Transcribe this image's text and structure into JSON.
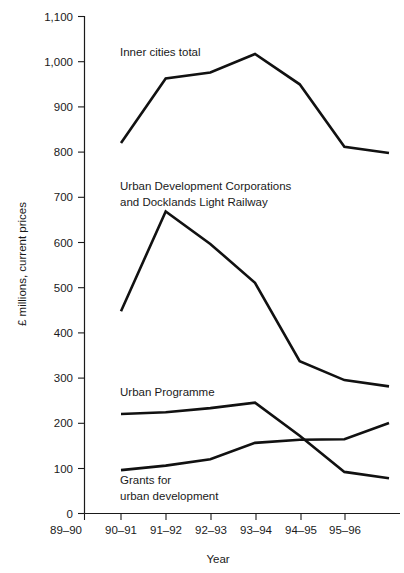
{
  "chart_data": {
    "type": "line",
    "title": "",
    "xlabel": "Year",
    "ylabel": "£ millions, current prices",
    "xlim": [
      0,
      8
    ],
    "ylim": [
      0,
      1100
    ],
    "grid": false,
    "legend_position": "inline-annotations",
    "categories": [
      "89–90",
      "90–91",
      "91–92",
      "92–93",
      "93–94",
      "94–95",
      "95–96",
      ""
    ],
    "y_ticks": [
      "0",
      "100",
      "200",
      "300",
      "400",
      "500",
      "600",
      "700",
      "800",
      "900",
      "1,000",
      "1,100"
    ],
    "y_tick_values": [
      0,
      100,
      200,
      300,
      400,
      500,
      600,
      700,
      800,
      900,
      1000,
      1100
    ],
    "series": [
      {
        "name": "Inner cities total",
        "label": "Inner cities total",
        "x": [
          "90–91",
          "91–92",
          "92–93",
          "93–94",
          "94–95",
          "95–96",
          ""
        ],
        "values": [
          819,
          962,
          975,
          1016,
          949,
          811,
          797
        ],
        "color": "#111111"
      },
      {
        "name": "Urban Development Corporations and Docklands Light Railway",
        "label_line1": "Urban Development Corporations",
        "label_line2": "and Docklands Light Railway",
        "x": [
          "90–91",
          "91–92",
          "92–93",
          "93–94",
          "94–95",
          "95–96",
          ""
        ],
        "values": [
          447,
          668,
          596,
          510,
          337,
          295,
          281
        ],
        "color": "#111111"
      },
      {
        "name": "Urban Programme",
        "label": "Urban Programme",
        "x": [
          "90–91",
          "91–92",
          "92–93",
          "93–94",
          "94–95",
          "95–96",
          ""
        ],
        "values": [
          220,
          224,
          233,
          245,
          172,
          92,
          78
        ],
        "color": "#111111"
      },
      {
        "name": "Grants for urban development",
        "label_line1": "Grants for",
        "label_line2": "urban development",
        "x": [
          "90–91",
          "91–92",
          "92–93",
          "93–94",
          "94–95",
          "95–96",
          ""
        ],
        "values": [
          96,
          106,
          120,
          156,
          163,
          164,
          200
        ],
        "color": "#111111"
      }
    ]
  },
  "axes": {
    "y_axis_title": "£ millions, current prices",
    "x_axis_title": "Year",
    "y_tick_labels": [
      "1,100",
      "1,000",
      "900",
      "800",
      "700",
      "600",
      "500",
      "400",
      "300",
      "200",
      "100",
      "0"
    ],
    "x_tick_labels": [
      "89–90",
      "90–91",
      "91–92",
      "92–93",
      "93–94",
      "94–95",
      "95–96"
    ]
  },
  "annotations": {
    "inner_cities": "Inner cities total",
    "udc_line1": "Urban Development Corporations",
    "udc_line2": "and Docklands Light Railway",
    "urban_programme": "Urban Programme",
    "grants_line1": "Grants for",
    "grants_line2": "urban development"
  },
  "colors": {
    "line": "#111111",
    "axis": "#1a1a1a",
    "background": "#ffffff",
    "text": "#1a1a1a"
  }
}
